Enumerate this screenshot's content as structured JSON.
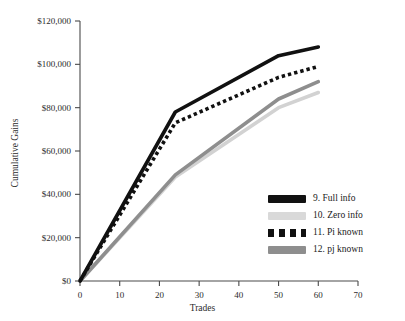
{
  "chart_data": {
    "type": "line",
    "title": "",
    "xlabel": "Trades",
    "ylabel": "Cumulative Gains",
    "xlim": [
      0,
      70
    ],
    "ylim": [
      0,
      120000
    ],
    "grid": false,
    "legend_position": "inside-bottom-right",
    "x_ticks": [
      0,
      10,
      20,
      30,
      40,
      50,
      60,
      70
    ],
    "x_tick_labels": [
      "0",
      "10",
      "20",
      "30",
      "40",
      "50",
      "60",
      "70"
    ],
    "y_ticks": [
      0,
      20000,
      40000,
      60000,
      80000,
      100000,
      120000
    ],
    "y_tick_labels": [
      "$0",
      "$20,000",
      "$40,000",
      "$60,000",
      "$80,000",
      "$100,000",
      "$120,000"
    ],
    "x": [
      0,
      24,
      50,
      60
    ],
    "series": [
      {
        "name": "9. Full info",
        "values": [
          0,
          78000,
          104000,
          108000
        ],
        "color": "#111111",
        "style": "solid",
        "width": 3.6
      },
      {
        "name": "10. Zero info",
        "values": [
          0,
          48000,
          80000,
          87000
        ],
        "color": "#d2d2d2",
        "style": "solid",
        "width": 3.6
      },
      {
        "name": "11. Pi known",
        "values": [
          0,
          73000,
          94000,
          99000
        ],
        "color": "#111111",
        "style": "dotted",
        "width": 3.6
      },
      {
        "name": "12. pj known",
        "values": [
          0,
          49000,
          84000,
          92000
        ],
        "color": "#8e8e8e",
        "style": "solid",
        "width": 3.6
      }
    ]
  },
  "legend": {
    "items": [
      {
        "label": "9. Full info",
        "swatch": "solid",
        "color": "#111111"
      },
      {
        "label": "10. Zero info",
        "swatch": "solid",
        "color": "#d9d9d9"
      },
      {
        "label": "11. Pi known",
        "swatch": "dotted",
        "color": "#111111"
      },
      {
        "label": "12. pj known",
        "swatch": "solid",
        "color": "#8e8e8e"
      }
    ]
  },
  "axes": {
    "axis_color": "#4a4a4a"
  }
}
